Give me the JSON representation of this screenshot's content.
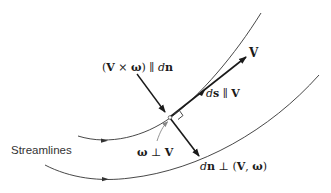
{
  "diagram": {
    "title": "",
    "labels": {
      "streamlines": "Streamlines",
      "V": "V",
      "cross": {
        "open": "(",
        "V": "V",
        "times": " × ",
        "omega": "ω",
        "close": ")",
        "parallel": " ∥ ",
        "d": "d",
        "n": "n"
      },
      "ds": {
        "d": "d",
        "s": "s",
        "parallel": " ∥ ",
        "V": "V"
      },
      "omega_perp_V": {
        "omega": "ω",
        "perp": " ⊥ ",
        "V": "V"
      },
      "dn": {
        "d": "d",
        "n": "n",
        "perp": " ⊥ ",
        "open": "(",
        "V": "V",
        "comma": ", ",
        "omega": "ω",
        "close": ")"
      }
    },
    "colors": {
      "line": "#333333",
      "arrow": "#1a1a1a",
      "gray_arrow": "#888888"
    }
  }
}
